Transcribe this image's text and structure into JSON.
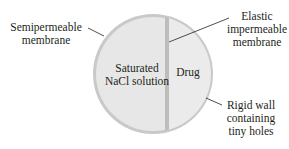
{
  "diagram": {
    "type": "osmotic drug delivery device cross-section",
    "colors": {
      "circle_fill": "#e6e6e6",
      "circle_outer_wall": "#c4c4c4",
      "divider_membrane": "#bcbcbc",
      "leader_line": "#231f20",
      "text": "#231f20",
      "background": "#ffffff"
    },
    "compartments": {
      "left": {
        "line1": "Saturated",
        "line2": "NaCl solution"
      },
      "right": {
        "line1": "Drug"
      }
    },
    "callouts": {
      "semipermeable": {
        "line1": "Semipermeable",
        "line2": "membrane"
      },
      "elastic": {
        "line1": "Elastic",
        "line2": "impermeable",
        "line3": "membrane"
      },
      "rigid": {
        "line1": "Rigid wall",
        "line2": "containing",
        "line3": "tiny holes"
      }
    }
  }
}
